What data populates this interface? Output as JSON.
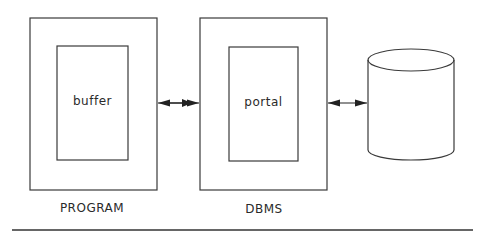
{
  "diagram": {
    "nodes": [
      {
        "id": "program",
        "label": "PROGRAM",
        "inner_label": "buffer"
      },
      {
        "id": "dbms",
        "label": "DBMS",
        "inner_label": "portal"
      },
      {
        "id": "database",
        "shape": "cylinder",
        "label": ""
      }
    ],
    "edges": [
      {
        "from": "program",
        "to": "dbms",
        "type": "bidirectional"
      },
      {
        "from": "dbms",
        "to": "database",
        "type": "bidirectional"
      }
    ]
  },
  "colors": {
    "stroke": "#3a3a3a",
    "background": "#ffffff",
    "text": "#2a2a2a"
  }
}
